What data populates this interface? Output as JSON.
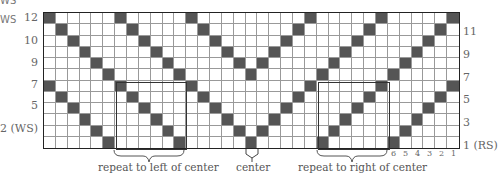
{
  "chart": {
    "type": "knitting-chart",
    "rows": 12,
    "columns": 35,
    "dark_color": "#555555",
    "light_color": "#ffffff",
    "grid_line_color": "#999999",
    "border_color": "#222222",
    "pattern_rule": "left half: dark at col (12-row) mod 6 for cols 0-17; right half mirrors about center col 17"
  },
  "labels": {
    "top_left_cut": "WS",
    "left_ws": "WS",
    "left_rows": [
      {
        "text": "12",
        "y": 12
      },
      {
        "text": "10",
        "y": 35
      },
      {
        "text": "9",
        "y": 57
      },
      {
        "text": "7",
        "y": 79
      },
      {
        "text": "5",
        "y": 100
      },
      {
        "text": "2 (WS)",
        "y": 123
      }
    ],
    "right_rows": [
      {
        "text": "11",
        "y": 26
      },
      {
        "text": "9",
        "y": 49
      },
      {
        "text": "7",
        "y": 72
      },
      {
        "text": "5",
        "y": 94
      },
      {
        "text": "3",
        "y": 117
      },
      {
        "text": "1 (RS)",
        "y": 140
      }
    ],
    "column_numbers": [
      "6",
      "5",
      "4",
      "3",
      "2",
      "1"
    ]
  },
  "annotations": {
    "repeat_left": "repeat to left of center",
    "center": "center",
    "repeat_right": "repeat to right of center"
  }
}
